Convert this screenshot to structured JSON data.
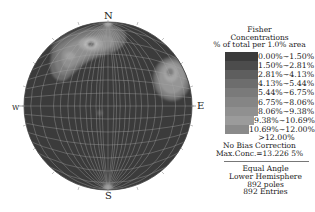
{
  "stereonet": {
    "labels": {
      "north": "N",
      "south": "S",
      "east": "E",
      "west": "W"
    },
    "center": [
      108,
      106
    ],
    "radius": 84,
    "background_color": "#3b3b3b",
    "grid_color": "#9a9a9a",
    "clusters": [
      {
        "name": "north-west-cluster",
        "center": [
          80,
          50
        ],
        "peak": "12.00%+"
      },
      {
        "name": "east-cluster",
        "center": [
          172,
          78
        ],
        "peak": "9.38%~10.69%"
      }
    ]
  },
  "legend": {
    "title": [
      "Fisher",
      "Concentrations",
      "% of total per 1.0% area"
    ],
    "ranges": [
      {
        "label": "0.00%~1.50%",
        "color": "#3b3b3b"
      },
      {
        "label": "1.50%~2.81%",
        "color": "#4c4c4c"
      },
      {
        "label": "2.81%~4.13%",
        "color": "#5e5e5e"
      },
      {
        "label": "4.13%~5.44%",
        "color": "#6d6d6d"
      },
      {
        "label": "5.44%~6.75%",
        "color": "#7a7a7a"
      },
      {
        "label": "6.75%~8.06%",
        "color": "#858585"
      },
      {
        "label": "8.06%~9.38%",
        "color": "#909090"
      },
      {
        "label": "9.38%~10.69%",
        "color": "#9b9b9b"
      },
      {
        "label": "10.69%~12.00%",
        "color": "#8a8a8a"
      }
    ],
    "over_label": ">12.00%",
    "bias_note": "No Bias Correction",
    "max_conc": "Max.Conc.=13.226 5%"
  },
  "info": {
    "projection": "Equal Angle",
    "hemisphere": "Lower Hemisphere",
    "poles": "892 poles",
    "entries": "892 Entries"
  }
}
